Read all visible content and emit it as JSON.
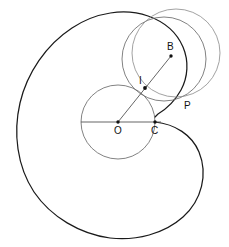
{
  "figure": {
    "width": 229,
    "height": 247,
    "background_color": "#ffffff",
    "spiral_stroke_color": "#1a1a1a",
    "circle_stroke_color": "#6b6b6b",
    "line_stroke_color": "#4a4a4a",
    "point_color": "#111111"
  },
  "points": [
    {
      "id": "O",
      "label": "O",
      "x": 118,
      "y": 122,
      "label_x": 114,
      "label_y": 134,
      "role": "center-of-base-circle"
    },
    {
      "id": "C",
      "label": "C",
      "x": 155,
      "y": 122,
      "label_x": 151,
      "label_y": 134,
      "role": "contact-point"
    },
    {
      "id": "I",
      "label": "I",
      "x": 145,
      "y": 88,
      "label_x": 139,
      "label_y": 84,
      "role": "intersection-point"
    },
    {
      "id": "B",
      "label": "B",
      "x": 171,
      "y": 56,
      "label_x": 168,
      "label_y": 50,
      "role": "moving-point"
    },
    {
      "id": "P",
      "label": "P",
      "x": 181,
      "y": 101,
      "label_x": 184,
      "label_y": 109,
      "role": "spiral-point"
    }
  ],
  "circles": [
    {
      "id": "base-circle",
      "label": "base circle centered at O",
      "cx": 118,
      "cy": 122,
      "r": 37
    },
    {
      "id": "rolling-circle",
      "label": "rolling circle through I B P",
      "cx": 164,
      "cy": 59,
      "r": 42
    },
    {
      "id": "outer-small-circle",
      "label": "second generating circle",
      "cx": 176,
      "cy": 53,
      "r": 44
    }
  ],
  "segments": [
    {
      "id": "diameter-OC",
      "label": "horizontal diameter through O and C",
      "x1": 81,
      "y1": 122,
      "x2": 160,
      "y2": 122
    },
    {
      "id": "ray-O-B",
      "label": "ray from O through I to B",
      "x1": 118,
      "y1": 122,
      "x2": 171,
      "y2": 56
    }
  ],
  "spiral": {
    "id": "main-spiral",
    "label": "spiral curve ending at C",
    "stroke_width": 1.25
  }
}
